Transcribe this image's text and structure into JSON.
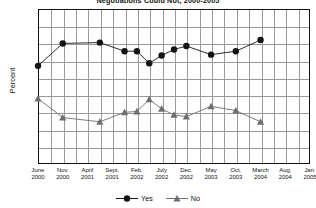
{
  "chart_data": {
    "type": "line",
    "title": "Negotiations Could Not, 2000-2005",
    "xlabel": "",
    "ylabel": "Percent",
    "ylim": [
      0,
      90
    ],
    "ytick_step": 10,
    "yticks": [
      "90",
      "80",
      "70",
      "60",
      "50",
      "40",
      "30",
      "20",
      "10",
      "0"
    ],
    "grid": true,
    "legend_position": "bottom-center",
    "categories": [
      "June 2000",
      "Nov. 2000",
      "April 2001",
      "Sept. 2001",
      "Feb. 2002",
      "July 2002",
      "Dec. 2002",
      "May 2003",
      "Oct. 2003",
      "March 2004",
      "Aug. 2004",
      "Jan. 2005",
      "June 2005",
      "Nov. 2005"
    ],
    "xticks": [
      {
        "month": "June",
        "year": "2000"
      },
      {
        "month": "Nov.",
        "year": "2000"
      },
      {
        "month": "April",
        "year": "2001"
      },
      {
        "month": "Sept.",
        "year": "2001"
      },
      {
        "month": "Feb.",
        "year": "2002"
      },
      {
        "month": "July",
        "year": "2002"
      },
      {
        "month": "Dec.",
        "year": "2002"
      },
      {
        "month": "May",
        "year": "2003"
      },
      {
        "month": "Oct.",
        "year": "2003"
      },
      {
        "month": "March",
        "year": "2004"
      },
      {
        "month": "Aug.",
        "year": "2004"
      },
      {
        "month": "Jan.",
        "year": "2005"
      },
      {
        "month": "June",
        "year": "2005"
      },
      {
        "month": "Nov.",
        "year": "2005"
      }
    ],
    "series": [
      {
        "name": "Yes",
        "marker": "circle",
        "color": "#141414",
        "x": [
          0,
          2,
          5,
          7,
          8,
          9,
          10,
          11,
          12,
          14,
          16,
          18,
          20,
          22
        ],
        "values": [
          57,
          70,
          70.5,
          65.5,
          65.5,
          58.5,
          63,
          66.5,
          68.5,
          63.5,
          65.5,
          72,
          null,
          null
        ]
      },
      {
        "name": "No",
        "marker": "triangle",
        "color": "#6e6e6e",
        "x": [
          0,
          2,
          5,
          7,
          8,
          9,
          10,
          11,
          12,
          14,
          16,
          18,
          20,
          22
        ],
        "values": [
          38,
          27,
          24.5,
          30,
          30.5,
          37.5,
          32,
          28.5,
          27.5,
          33.5,
          31,
          24.5,
          null,
          null
        ]
      }
    ],
    "legend": [
      {
        "label": "Yes",
        "marker": "circle",
        "color": "#141414"
      },
      {
        "label": "No",
        "marker": "triangle",
        "color": "#6e6e6e"
      }
    ]
  }
}
